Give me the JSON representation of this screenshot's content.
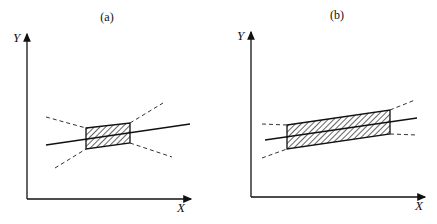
{
  "panels": [
    {
      "id": "a",
      "title": "(a)",
      "y_axis_label": "Y",
      "x_axis_label": "X",
      "description": "Narrow shaded confidence band around regression line; dashed bounds diverge sharply"
    },
    {
      "id": "b",
      "title": "(b)",
      "y_axis_label": "Y",
      "x_axis_label": "X",
      "description": "Wide shaded confidence band around regression line; dashed bounds diverge gradually"
    }
  ],
  "colors": {
    "ink": "#111111",
    "background": "#ffffff"
  }
}
